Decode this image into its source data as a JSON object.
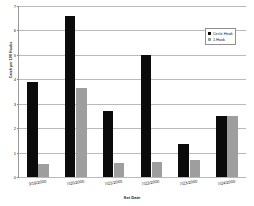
{
  "chart_data": {
    "type": "bar",
    "title": "",
    "xlabel": "Set Date",
    "ylabel": "Catch per 100 Hooks",
    "categories": [
      "3/19/2000",
      "7/20/2000",
      "7/21/2000",
      "7/22/2000",
      "7/23/2000",
      "7/24/2000"
    ],
    "series": [
      {
        "name": "Circle Hook",
        "color": "#0b0b0b",
        "values": [
          3.9,
          6.6,
          2.7,
          5.0,
          1.35,
          2.5
        ]
      },
      {
        "name": "J-Hook",
        "color": "#9e9e9e",
        "values": [
          0.55,
          3.65,
          0.57,
          0.6,
          0.7,
          2.5
        ]
      }
    ],
    "ylim": [
      0,
      7
    ],
    "yticks": [
      0,
      1,
      2,
      3,
      4,
      5,
      6,
      7
    ],
    "ytick_labels": [
      "0",
      "1",
      "2",
      "3",
      "4",
      "5",
      "6",
      "7"
    ],
    "grid": true,
    "legend_position": "top-right"
  }
}
